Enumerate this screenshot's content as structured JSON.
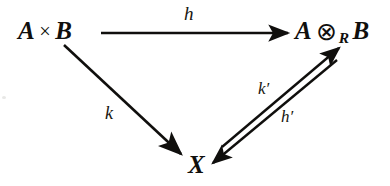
{
  "diagram": {
    "kind": "commutative-triangle",
    "ink_color": "#100f0d",
    "background_color": "#ffffff",
    "nodes": [
      {
        "id": "axb",
        "label": "A × B",
        "left_term": "A",
        "operator": "×",
        "right_term": "B",
        "position": "top-left"
      },
      {
        "id": "tensor",
        "label": "A ⊗R B",
        "left_term": "A",
        "operator": "⊗",
        "operator_subscript": "R",
        "right_term": "B",
        "position": "top-right"
      },
      {
        "id": "x",
        "label": "X",
        "position": "bottom-center"
      }
    ],
    "edges": [
      {
        "id": "h",
        "label": "h",
        "from": "axb",
        "to": "tensor",
        "style": "single-arrow",
        "orientation": "horizontal",
        "label_position": "above"
      },
      {
        "id": "k",
        "label": "k",
        "from": "axb",
        "to": "x",
        "style": "single-arrow",
        "orientation": "diagonal-down-right",
        "label_position": "left"
      },
      {
        "id": "kprime",
        "label": "k′",
        "from": "x",
        "to": "tensor",
        "style": "single-arrow",
        "orientation": "diagonal-up-right",
        "label_position": "above-left"
      },
      {
        "id": "hprime",
        "label": "h′",
        "from": "tensor",
        "to": "x",
        "style": "single-arrow",
        "orientation": "diagonal-down-left",
        "label_position": "below-right"
      }
    ]
  }
}
